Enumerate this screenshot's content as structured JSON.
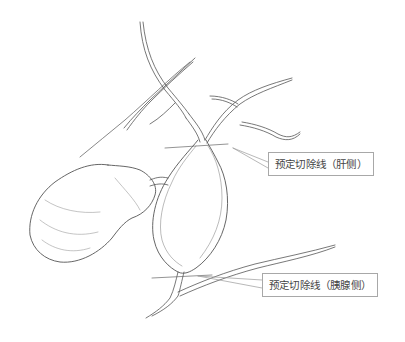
{
  "figure": {
    "line_color": "#555555",
    "callouts": [
      {
        "id": "liver-side",
        "label": "预定切除线（肝侧）"
      },
      {
        "id": "pancreas-side",
        "label": "预定切除线（胰腺侧）"
      }
    ]
  }
}
